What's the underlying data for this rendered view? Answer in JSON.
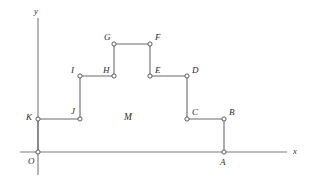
{
  "figure": {
    "background_color": "#ffffff",
    "line_color": "#6b6b6b",
    "label_color": "#2b2b2b",
    "axis_color": "#7a7a7a",
    "width": 311,
    "height": 185
  },
  "axes": {
    "x_label": "x",
    "y_label": "y",
    "origin_label": "O",
    "x_axis": {
      "x1": 20,
      "y1": 152,
      "x2": 287,
      "y2": 152
    },
    "y_axis": {
      "x1": 38,
      "y1": 18,
      "x2": 38,
      "y2": 175
    },
    "x_label_pos": {
      "x": 293,
      "y": 147
    },
    "y_label_pos": {
      "x": 34,
      "y": 7
    },
    "origin_label_pos": {
      "x": 28,
      "y": 157
    }
  },
  "points": [
    {
      "id": "A",
      "label": "A",
      "x": 224,
      "y": 152,
      "label_x": 220,
      "label_y": 158
    },
    {
      "id": "B",
      "label": "B",
      "x": 224,
      "y": 119,
      "label_x": 229,
      "label_y": 108
    },
    {
      "id": "C",
      "label": "C",
      "x": 187,
      "y": 119,
      "label_x": 192,
      "label_y": 108
    },
    {
      "id": "D",
      "label": "D",
      "x": 187,
      "y": 76,
      "label_x": 192,
      "label_y": 66
    },
    {
      "id": "E",
      "label": "E",
      "x": 150,
      "y": 76,
      "label_x": 155,
      "label_y": 66
    },
    {
      "id": "F",
      "label": "F",
      "x": 150,
      "y": 44,
      "label_x": 155,
      "label_y": 33
    },
    {
      "id": "G",
      "label": "G",
      "x": 114,
      "y": 44,
      "label_x": 104,
      "label_y": 33
    },
    {
      "id": "H",
      "label": "H",
      "x": 114,
      "y": 76,
      "label_x": 103,
      "label_y": 66
    },
    {
      "id": "I",
      "label": "I",
      "x": 80,
      "y": 76,
      "label_x": 71,
      "label_y": 66
    },
    {
      "id": "J",
      "label": "J",
      "x": 80,
      "y": 119,
      "label_x": 71,
      "label_y": 107
    },
    {
      "id": "K",
      "label": "K",
      "x": 38,
      "y": 119,
      "label_x": 26,
      "label_y": 113
    },
    {
      "id": "O",
      "label": "O",
      "x": 38,
      "y": 152,
      "label_x": 28,
      "label_y": 157
    }
  ],
  "region": {
    "label": "M",
    "label_x": 124,
    "label_y": 113
  },
  "path_order": [
    "A",
    "B",
    "C",
    "D",
    "E",
    "F",
    "G",
    "H",
    "I",
    "J",
    "K",
    "O"
  ],
  "marker": {
    "radius": 2.1,
    "fill": "#ffffff",
    "stroke": "#5a5a5a",
    "stroke_width": 1
  }
}
